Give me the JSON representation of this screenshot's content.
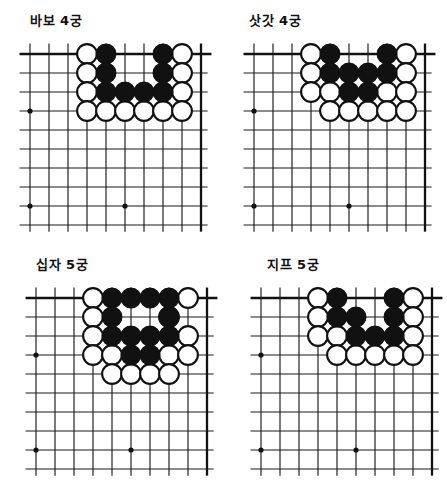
{
  "page": {
    "kind": "go-shape-diagram-sheet",
    "background": "#ffffff",
    "ink": "#111111",
    "panel_count": 4
  },
  "panels": [
    {
      "title": "바보 4궁",
      "name": "diagram-babo-4gung"
    },
    {
      "title": "삿갓 4궁",
      "name": "diagram-satgat-4gung"
    },
    {
      "title": "십자 5궁",
      "name": "diagram-sipja-5gung"
    },
    {
      "title": "지프 5궁",
      "name": "diagram-jipeu-5gung"
    }
  ],
  "chart_data": [
    {
      "type": "table",
      "title": "바보 4궁",
      "board": {
        "cols": 10,
        "rows": 10,
        "spacing": 19,
        "corner": "top-right-open",
        "star_points": [
          [
            1,
            4
          ],
          [
            1,
            9
          ],
          [
            6,
            9
          ]
        ]
      },
      "legend": {
        "B": "black stone",
        "W": "white stone",
        ".": "empty"
      },
      "columns": [
        "c1",
        "c2",
        "c3",
        "c4",
        "c5",
        "c6",
        "c7",
        "c8",
        "c9",
        "c10"
      ],
      "rows": [
        "...WB..BW.",
        "...WB..BW.",
        "...WBBBBW.",
        "...WWWWWW."
      ],
      "stones": {
        "white": [
          [
            4,
            1
          ],
          [
            9,
            1
          ],
          [
            4,
            2
          ],
          [
            9,
            2
          ],
          [
            4,
            3
          ],
          [
            9,
            3
          ],
          [
            4,
            4
          ],
          [
            5,
            4
          ],
          [
            6,
            4
          ],
          [
            7,
            4
          ],
          [
            8,
            4
          ],
          [
            9,
            4
          ]
        ],
        "black": [
          [
            5,
            1
          ],
          [
            8,
            1
          ],
          [
            5,
            2
          ],
          [
            8,
            2
          ],
          [
            5,
            3
          ],
          [
            6,
            3
          ],
          [
            7,
            3
          ],
          [
            8,
            3
          ]
        ]
      },
      "counts": {
        "white": 12,
        "black": 8
      }
    },
    {
      "type": "table",
      "title": "삿갓 4궁",
      "board": {
        "cols": 10,
        "rows": 10,
        "spacing": 19,
        "corner": "top-right-open",
        "star_points": [
          [
            1,
            4
          ],
          [
            1,
            9
          ],
          [
            6,
            9
          ]
        ]
      },
      "legend": {
        "B": "black stone",
        "W": "white stone",
        ".": "empty"
      },
      "columns": [
        "c1",
        "c2",
        "c3",
        "c4",
        "c5",
        "c6",
        "c7",
        "c8",
        "c9",
        "c10"
      ],
      "rows": [
        "...WB..BW.",
        "...WBB.BBW",
        "...WWBBBWW",
        "....WWWWW."
      ],
      "stones": {
        "white": [
          [
            4,
            1
          ],
          [
            9,
            1
          ],
          [
            4,
            2
          ],
          [
            9,
            2
          ],
          [
            4,
            3
          ],
          [
            5,
            3
          ],
          [
            8,
            3
          ],
          [
            9,
            3
          ],
          [
            5,
            4
          ],
          [
            6,
            4
          ],
          [
            7,
            4
          ],
          [
            8,
            4
          ],
          [
            9,
            4
          ]
        ],
        "black": [
          [
            5,
            1
          ],
          [
            8,
            1
          ],
          [
            5,
            2
          ],
          [
            6,
            2
          ],
          [
            7,
            2
          ],
          [
            8,
            2
          ],
          [
            6,
            3
          ],
          [
            7,
            3
          ]
        ]
      },
      "counts": {
        "white": 13,
        "black": 8
      }
    },
    {
      "type": "table",
      "title": "십자 5궁",
      "board": {
        "cols": 10,
        "rows": 10,
        "spacing": 19,
        "corner": "top-right-open",
        "star_points": [
          [
            1,
            4
          ],
          [
            1,
            9
          ],
          [
            6,
            9
          ]
        ]
      },
      "legend": {
        "B": "black stone",
        "W": "white stone",
        ".": "empty"
      },
      "columns": [
        "c1",
        "c2",
        "c3",
        "c4",
        "c5",
        "c6",
        "c7",
        "c8",
        "c9",
        "c10"
      ],
      "rows": [
        "...WBB.BBW",
        "...WB..BW.",
        "...WBB.BBW",
        "...WWBBBWW",
        "....WWWWW."
      ],
      "stones": {
        "white": [
          [
            4,
            1
          ],
          [
            9,
            1
          ],
          [
            4,
            2
          ],
          [
            8,
            2
          ],
          [
            4,
            3
          ],
          [
            9,
            3
          ],
          [
            4,
            4
          ],
          [
            5,
            4
          ],
          [
            8,
            4
          ],
          [
            9,
            4
          ],
          [
            5,
            5
          ],
          [
            6,
            5
          ],
          [
            7,
            5
          ],
          [
            8,
            5
          ]
        ],
        "black": [
          [
            5,
            1
          ],
          [
            6,
            1
          ],
          [
            7,
            1
          ],
          [
            8,
            1
          ],
          [
            5,
            2
          ],
          [
            8,
            2
          ],
          [
            5,
            3
          ],
          [
            6,
            3
          ],
          [
            7,
            3
          ],
          [
            8,
            3
          ],
          [
            6,
            4
          ],
          [
            7,
            4
          ]
        ]
      },
      "counts": {
        "white": 14,
        "black": 12
      }
    },
    {
      "type": "table",
      "title": "지프 5궁",
      "board": {
        "cols": 10,
        "rows": 10,
        "spacing": 19,
        "corner": "top-right-open",
        "star_points": [
          [
            1,
            4
          ],
          [
            1,
            9
          ],
          [
            6,
            9
          ]
        ]
      },
      "legend": {
        "B": "black stone",
        "W": "white stone",
        ".": "empty"
      },
      "columns": [
        "c1",
        "c2",
        "c3",
        "c4",
        "c5",
        "c6",
        "c7",
        "c8",
        "c9",
        "c10"
      ],
      "rows": [
        "...WB..BW.",
        "...WBB.BW.",
        "...WWBBBBW",
        "....WWWWWW"
      ],
      "stones": {
        "white": [
          [
            4,
            1
          ],
          [
            9,
            1
          ],
          [
            4,
            2
          ],
          [
            9,
            2
          ],
          [
            4,
            3
          ],
          [
            5,
            3
          ],
          [
            9,
            3
          ],
          [
            5,
            4
          ],
          [
            6,
            4
          ],
          [
            7,
            4
          ],
          [
            8,
            4
          ],
          [
            9,
            4
          ]
        ],
        "black": [
          [
            5,
            1
          ],
          [
            8,
            1
          ],
          [
            5,
            2
          ],
          [
            6,
            2
          ],
          [
            8,
            2
          ],
          [
            6,
            3
          ],
          [
            7,
            3
          ],
          [
            8,
            3
          ]
        ]
      },
      "counts": {
        "white": 12,
        "black": 8
      }
    }
  ]
}
